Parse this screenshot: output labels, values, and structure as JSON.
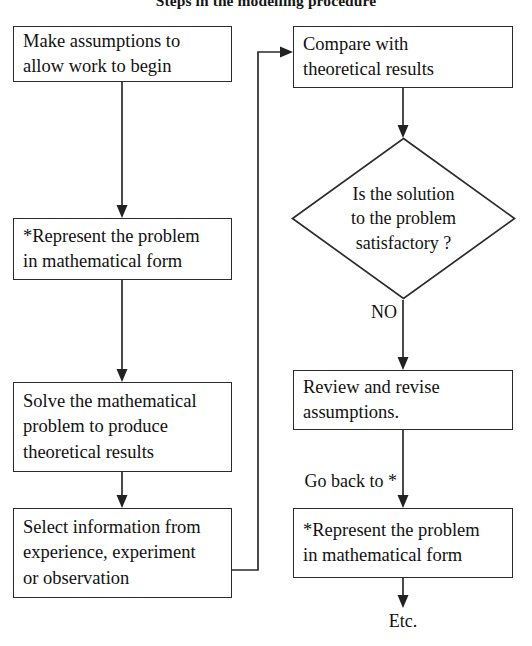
{
  "title": "Steps in the modelling procedure",
  "diagram": {
    "type": "flowchart",
    "left_column": {
      "nodes": [
        {
          "id": "make-assumptions",
          "shape": "process",
          "lines": [
            "Make assumptions to",
            "allow work to begin"
          ]
        },
        {
          "id": "represent-problem",
          "shape": "process",
          "lines": [
            "*Represent the problem",
            "in mathematical form"
          ]
        },
        {
          "id": "solve-problem",
          "shape": "process",
          "lines": [
            "Solve the mathematical",
            "problem to produce",
            "theoretical results"
          ]
        },
        {
          "id": "select-information",
          "shape": "process",
          "lines": [
            "Select information from",
            "experience, experiment",
            "or observation"
          ]
        }
      ]
    },
    "right_column": {
      "nodes": [
        {
          "id": "compare-results",
          "shape": "process",
          "lines": [
            "Compare with",
            "theoretical results"
          ]
        },
        {
          "id": "is-solution-satisfactory",
          "shape": "decision",
          "lines": [
            "Is the solution",
            "to the problem",
            "satisfactory ?"
          ]
        },
        {
          "id": "review-revise",
          "shape": "process",
          "lines": [
            "Review and revise",
            "assumptions."
          ]
        },
        {
          "id": "represent-problem-again",
          "shape": "process",
          "lines": [
            "*Represent the problem",
            "in mathematical form"
          ]
        }
      ]
    },
    "edge_labels": {
      "decision_no": "NO",
      "go_back": "Go back to *"
    },
    "terminal_label": "Etc.",
    "colors": {
      "stroke": "#2b2b2b",
      "text": "#111111",
      "background": "#ffffff"
    }
  }
}
